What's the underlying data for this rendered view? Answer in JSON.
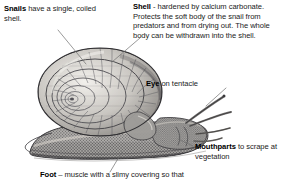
{
  "diagram": {
    "subject": "snail",
    "background_color": "#ffffff",
    "text_color": "#1b1b1b",
    "leader_line_color": "#6f6f6f"
  },
  "annotations": {
    "snails": {
      "term": "Snails",
      "text": " have a single, coiled shell."
    },
    "shell": {
      "term": "Shell",
      "text": " - hardened by calcium carbonate. Protects the soft body of the snail from predators and from drying out. The whole body can be withdrawn into the shell."
    },
    "eye": {
      "term": "Eye",
      "text": " on tentacle"
    },
    "mouthparts": {
      "term": "Mouthparts",
      "text": " to scrape at vegetation"
    },
    "foot": {
      "term": "Foot",
      "text": " – muscle with a slimy covering so that"
    }
  },
  "illustration": {
    "name": "snail-engraving",
    "parts": [
      "shell",
      "foot",
      "head",
      "tentacles",
      "eye"
    ],
    "style": "monochrome engraving"
  }
}
